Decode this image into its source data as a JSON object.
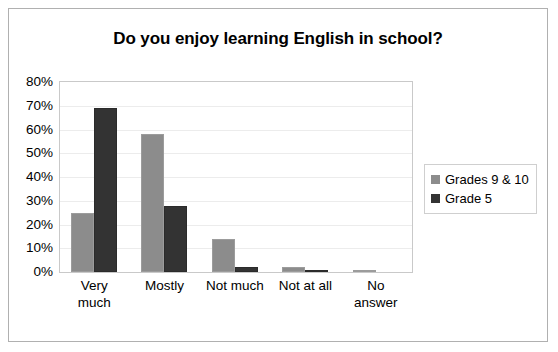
{
  "chart_data": {
    "type": "bar",
    "title": "Do you enjoy learning English in school?",
    "xlabel": "",
    "ylabel": "",
    "ylim": [
      0,
      80
    ],
    "ytick_labels": [
      "80%",
      "70%",
      "60%",
      "50%",
      "40%",
      "30%",
      "20%",
      "10%",
      "0%"
    ],
    "ytick_values": [
      80,
      70,
      60,
      50,
      40,
      30,
      20,
      10,
      0
    ],
    "grid": true,
    "legend_position": "right",
    "categories": [
      "Very much",
      "Mostly",
      "Not much",
      "Not at all",
      "No answer"
    ],
    "category_lines": [
      [
        "Very",
        "much"
      ],
      [
        "Mostly"
      ],
      [
        "Not much"
      ],
      [
        "Not at all"
      ],
      [
        "No",
        "answer"
      ]
    ],
    "series": [
      {
        "name": "Grades 9 & 10",
        "color": "#8c8c8c",
        "values": [
          25,
          58,
          14,
          2,
          1
        ]
      },
      {
        "name": "Grade 5",
        "color": "#333333",
        "values": [
          69,
          28,
          2,
          1,
          0
        ]
      }
    ]
  },
  "legend": {
    "entries": [
      {
        "label": "Grades 9 & 10"
      },
      {
        "label": "Grade 5"
      }
    ]
  }
}
